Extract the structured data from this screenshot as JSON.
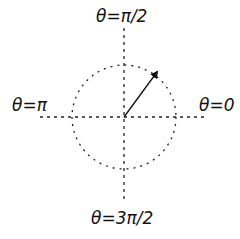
{
  "diagram": {
    "labels": {
      "top": "θ=π/2",
      "left": "θ=π",
      "right": "θ=0",
      "bottom": "θ=3π/2"
    },
    "center": [
      124,
      117
    ],
    "radius": 52,
    "arrow": {
      "from": [
        124,
        117
      ],
      "to": [
        158,
        71
      ]
    },
    "line_color": "#222222"
  }
}
